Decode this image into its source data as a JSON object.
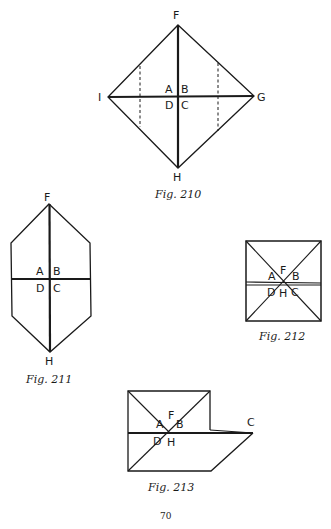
{
  "page_number": "70",
  "figures": [
    {
      "id": "fig210",
      "caption": "Fig. 210",
      "shape": "diamond with center cross and two dashed vertical fold lines",
      "labels": {
        "top": "F",
        "left": "I",
        "right": "G",
        "bottom": "H",
        "q1": "A",
        "q2": "B",
        "q3": "D",
        "q4": "C"
      }
    },
    {
      "id": "fig211",
      "caption": "Fig. 211",
      "shape": "elongated hexagon with center cross",
      "labels": {
        "top": "F",
        "bottom": "H",
        "q1": "A",
        "q2": "B",
        "q3": "D",
        "q4": "C"
      }
    },
    {
      "id": "fig212",
      "caption": "Fig. 212",
      "shape": "square with diagonals and horizontal midline",
      "labels": {
        "top": "F",
        "bottom": "H",
        "q1": "A",
        "q2": "B",
        "q3": "D",
        "q4": "C"
      }
    },
    {
      "id": "fig213",
      "caption": "Fig. 213",
      "shape": "square with diagonals extended into parallelogram flap",
      "labels": {
        "top": "F",
        "bottom": "H",
        "q1": "A",
        "q2": "B",
        "q3": "D",
        "right": "C"
      }
    }
  ],
  "colors": {
    "ink": "#1a1a1a",
    "paper": "#ffffff"
  }
}
